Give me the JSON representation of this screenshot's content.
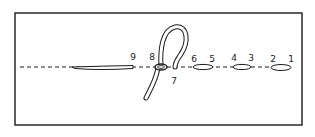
{
  "diagram": {
    "title": "",
    "type": "embroidery stitch diagram",
    "stroke_color": "#1a1a1a",
    "background_color": "#ffffff",
    "points": [
      {
        "id": "1",
        "label": "1",
        "x": 291,
        "y": 59
      },
      {
        "id": "2",
        "label": "2",
        "x": 273,
        "y": 59
      },
      {
        "id": "3",
        "label": "3",
        "x": 251,
        "y": 58
      },
      {
        "id": "4",
        "label": "4",
        "x": 234,
        "y": 58
      },
      {
        "id": "5",
        "label": "5",
        "x": 212,
        "y": 59
      },
      {
        "id": "6",
        "label": "6",
        "x": 194,
        "y": 59
      },
      {
        "id": "7",
        "label": "7",
        "x": 174,
        "y": 81
      },
      {
        "id": "8",
        "label": "8",
        "x": 152,
        "y": 57
      },
      {
        "id": "9",
        "label": "9",
        "x": 133,
        "y": 57
      }
    ],
    "elements": {
      "border": "fabric-frame",
      "guide_line": "dashed stitch line",
      "stitches": [
        "stitch 2-1",
        "stitch 4-3",
        "stitch 6-5"
      ],
      "working_thread": "thread loop through 8 emerging at 7",
      "completed_thread": "laid thread ending at 9"
    }
  }
}
